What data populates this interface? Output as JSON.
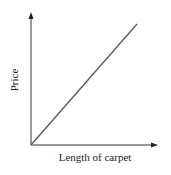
{
  "chart_data": {
    "type": "line",
    "title": "",
    "xlabel": "Length of carpet",
    "ylabel": "Price",
    "x_ticks": [],
    "y_ticks": [],
    "grid": false,
    "legend": null,
    "series": [
      {
        "name": "Price vs length",
        "points": [
          [
            0,
            0
          ],
          [
            1,
            1
          ]
        ],
        "description": "straight line through the origin with constant positive slope (direct proportion)"
      }
    ],
    "xlim": [
      0,
      1
    ],
    "ylim": [
      0,
      1
    ],
    "colors": {
      "axis": "#333333",
      "line": "#555555"
    }
  }
}
